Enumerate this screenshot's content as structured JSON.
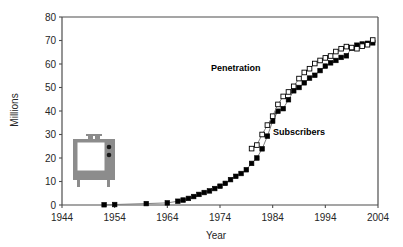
{
  "chart_data": {
    "type": "line",
    "title": "",
    "xlabel": "Year",
    "ylabel": "Millions",
    "xlim": [
      1944,
      2004
    ],
    "ylim": [
      0,
      80
    ],
    "xticks": [
      1944,
      1954,
      1964,
      1974,
      1984,
      1994,
      2004
    ],
    "yticks": [
      0,
      10,
      20,
      30,
      40,
      50,
      60,
      70,
      80
    ],
    "grid": false,
    "legend": "inline-annotations",
    "annotations": [
      {
        "text": "Penetration",
        "x": 1977,
        "y": 57
      },
      {
        "text": "Subscribers",
        "x": 1989,
        "y": 30
      }
    ],
    "series": [
      {
        "name": "Subscribers",
        "marker": "filled-square",
        "color": "#000000",
        "line_color": "#808080",
        "x": [
          1952,
          1954,
          1960,
          1964,
          1966,
          1967,
          1968,
          1969,
          1970,
          1971,
          1972,
          1973,
          1974,
          1975,
          1976,
          1977,
          1978,
          1979,
          1980,
          1981,
          1982,
          1983,
          1984,
          1985,
          1986,
          1987,
          1988,
          1989,
          1990,
          1991,
          1992,
          1993,
          1994,
          1995,
          1996,
          1997,
          1998,
          1999,
          2000,
          2001,
          2002,
          2003
        ],
        "values": [
          0.1,
          0.2,
          0.6,
          0.9,
          1.6,
          2.1,
          2.8,
          3.6,
          4.5,
          5.3,
          6.0,
          7.0,
          8.0,
          9.2,
          10.8,
          12.2,
          13.4,
          15.0,
          17.7,
          20.0,
          23.9,
          29.3,
          35.7,
          39.9,
          41.0,
          44.8,
          48.6,
          50.0,
          52.0,
          54.0,
          55.2,
          57.2,
          59.1,
          60.5,
          61.5,
          62.8,
          63.5,
          66.8,
          68.0,
          68.5,
          68.8,
          69.0
        ]
      },
      {
        "name": "Penetration",
        "marker": "open-square",
        "color": "#ffffff",
        "line_color": "#808080",
        "x": [
          1980,
          1981,
          1982,
          1983,
          1984,
          1985,
          1986,
          1987,
          1988,
          1989,
          1990,
          1991,
          1992,
          1993,
          1994,
          1995,
          1996,
          1997,
          1998,
          1999,
          2000,
          2001,
          2002,
          2003
        ],
        "values": [
          24.0,
          25.5,
          30.0,
          34.0,
          37.8,
          42.8,
          46.2,
          48.1,
          50.5,
          53.8,
          56.4,
          58.0,
          60.2,
          61.5,
          62.6,
          63.4,
          65.3,
          66.5,
          67.4,
          67.0,
          66.5,
          67.6,
          68.2,
          70.2
        ]
      }
    ]
  },
  "decor": {
    "tv_icon_name": "vintage-tv-icon",
    "tv_color": "#8c8c8c"
  }
}
